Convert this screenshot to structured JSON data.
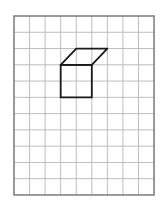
{
  "diagram": {
    "type": "grid-drawing",
    "grid": {
      "columns": 9,
      "rows": 11,
      "origin_px": [
        14,
        16
      ],
      "cell_w_px": 15.56,
      "cell_h_px": 16.27,
      "line_color": "#bdbdbd",
      "border_color": "#7a7a7a"
    },
    "shape": {
      "name": "open-box-front-and-top",
      "stroke_color": "#1a1a1a",
      "front_square": [
        [
          3,
          3
        ],
        [
          5,
          3
        ],
        [
          5,
          5
        ],
        [
          3,
          5
        ]
      ],
      "top_parallelogram": [
        [
          3,
          3
        ],
        [
          4,
          2
        ],
        [
          6,
          2
        ],
        [
          5,
          3
        ]
      ]
    }
  }
}
